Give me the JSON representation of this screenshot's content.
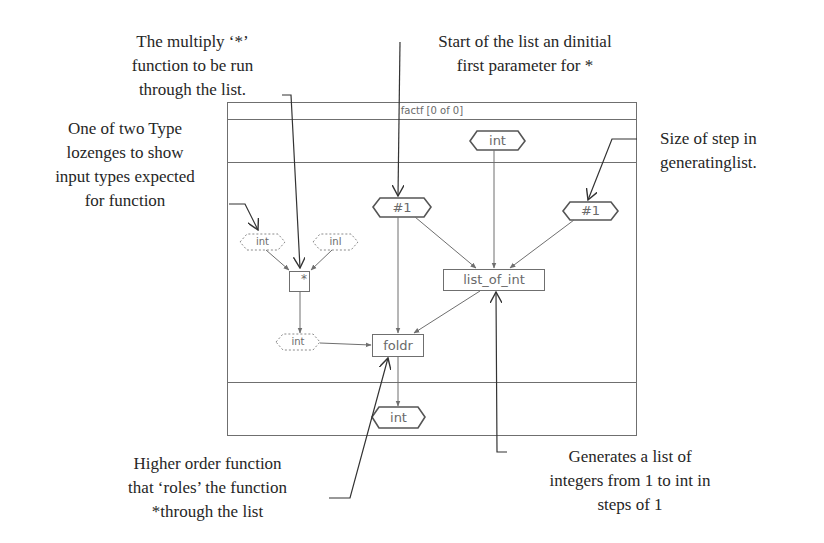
{
  "annotations": {
    "multiply": "The multiply ‘*’\nfunction to be run\nthrough the list.",
    "start_of_list": "Start of the list an dinitial\nfirst parameter for *",
    "type_lozenges": "One of two Type\nlozenges to show\ninput types expected\nfor function",
    "step_size": "Size of step in\ngeneratinglist.",
    "higher_order": "Higher order function\nthat ‘roles’ the function\n*through the list",
    "generates_list": "Generates a list of\nintegers from 1 to int in\nsteps of 1"
  },
  "frame": {
    "title": "factf [0 of 0]"
  },
  "nodes": {
    "input_int": "int",
    "start_const": "#1",
    "step_const": "#1",
    "type_int_left": "int",
    "type_int_right": "inl",
    "multiply_fn": "*",
    "list_of_int_fn": "list_of_int",
    "type_int_result": "int",
    "foldr_fn": "foldr",
    "output_int": "int"
  },
  "colors": {
    "diagram_line": "#6f6f6f",
    "annotation_text": "#262626",
    "callout_line": "#333333"
  }
}
